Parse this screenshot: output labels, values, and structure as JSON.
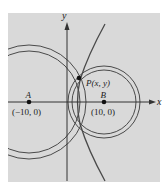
{
  "figure": {
    "background_color": "#ffffff",
    "panel_color": "#d9d9d9",
    "stroke_color": "#4a4a4a",
    "axis_color": "#333333"
  },
  "axes": {
    "x_label": "x",
    "y_label": "y"
  },
  "points": {
    "A": {
      "name": "A",
      "coords": "(−10, 0)",
      "x": -10,
      "y": 0
    },
    "B": {
      "name": "B",
      "coords": "(10, 0)",
      "x": 10,
      "y": 0
    },
    "P": {
      "name": "P(x, y)",
      "label_prefix": "P",
      "label_args": "(x, y)"
    }
  },
  "curves": [
    {
      "type": "circle-pair",
      "center": "A",
      "description": "Two concentric circles centered at A"
    },
    {
      "type": "circle-pair",
      "center": "B",
      "description": "Two concentric circles centered at B"
    },
    {
      "type": "hyperbola-branch",
      "description": "Right branch of hyperbola with foci A and B passing through P"
    }
  ]
}
